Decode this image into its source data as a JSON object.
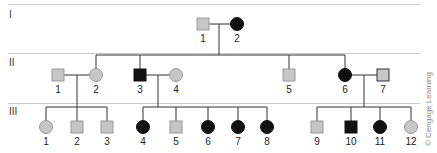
{
  "colors": {
    "affected": "#111111",
    "unaffected": "#c6c6c6",
    "unaffected_stroke": "#999999",
    "line": "#333333",
    "separator": "#c8c8c8"
  },
  "generations": [
    {
      "label": "I",
      "individuals": [
        {
          "id": "I-1",
          "num": "1",
          "sex": "male",
          "affected": false
        },
        {
          "id": "I-2",
          "num": "2",
          "sex": "female",
          "affected": true
        }
      ]
    },
    {
      "label": "II",
      "individuals": [
        {
          "id": "II-1",
          "num": "1",
          "sex": "male",
          "affected": false,
          "note": "married in"
        },
        {
          "id": "II-2",
          "num": "2",
          "sex": "female",
          "affected": false
        },
        {
          "id": "II-3",
          "num": "3",
          "sex": "male",
          "affected": true
        },
        {
          "id": "II-4",
          "num": "4",
          "sex": "female",
          "affected": false,
          "note": "married in"
        },
        {
          "id": "II-5",
          "num": "5",
          "sex": "male",
          "affected": false
        },
        {
          "id": "II-6",
          "num": "6",
          "sex": "female",
          "affected": true
        },
        {
          "id": "II-7",
          "num": "7",
          "sex": "male",
          "affected": false,
          "note": "married in"
        }
      ]
    },
    {
      "label": "III",
      "individuals": [
        {
          "id": "III-1",
          "num": "1",
          "sex": "female",
          "affected": false
        },
        {
          "id": "III-2",
          "num": "2",
          "sex": "male",
          "affected": false
        },
        {
          "id": "III-3",
          "num": "3",
          "sex": "male",
          "affected": false
        },
        {
          "id": "III-4",
          "num": "4",
          "sex": "female",
          "affected": true
        },
        {
          "id": "III-5",
          "num": "5",
          "sex": "male",
          "affected": false
        },
        {
          "id": "III-6",
          "num": "6",
          "sex": "female",
          "affected": true
        },
        {
          "id": "III-7",
          "num": "7",
          "sex": "female",
          "affected": true
        },
        {
          "id": "III-8",
          "num": "8",
          "sex": "female",
          "affected": true
        },
        {
          "id": "III-9",
          "num": "9",
          "sex": "male",
          "affected": false
        },
        {
          "id": "III-10",
          "num": "10",
          "sex": "male",
          "affected": true
        },
        {
          "id": "III-11",
          "num": "11",
          "sex": "female",
          "affected": true
        },
        {
          "id": "III-12",
          "num": "12",
          "sex": "female",
          "affected": false
        }
      ]
    }
  ],
  "matings": [
    {
      "partners": [
        "I-1",
        "I-2"
      ],
      "children": [
        "II-2",
        "II-3",
        "II-5",
        "II-6"
      ]
    },
    {
      "partners": [
        "II-1",
        "II-2"
      ],
      "children": [
        "III-1",
        "III-2",
        "III-3"
      ]
    },
    {
      "partners": [
        "II-3",
        "II-4"
      ],
      "children": [
        "III-4",
        "III-5",
        "III-6",
        "III-7",
        "III-8"
      ]
    },
    {
      "partners": [
        "II-6",
        "II-7"
      ],
      "children": [
        "III-9",
        "III-10",
        "III-11",
        "III-12"
      ]
    }
  ],
  "credit": "© Cengage Learning"
}
